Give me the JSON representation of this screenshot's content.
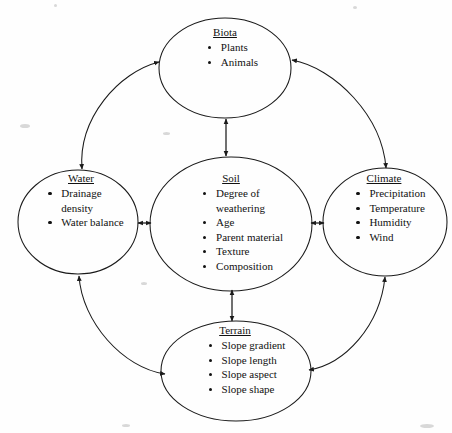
{
  "diagram": {
    "stroke_color": "#1a1a1a",
    "text_color": "#111111",
    "background_color": "#fefefe",
    "nodes": [
      {
        "id": "biota",
        "title": "Biota",
        "items": [
          "Plants",
          "Animals"
        ]
      },
      {
        "id": "water",
        "title": "Water",
        "items": [
          "Drainage\ndensity",
          "Water balance"
        ]
      },
      {
        "id": "soil",
        "title": "Soil",
        "items": [
          "Degree of\nweathering",
          "Age",
          "Parent material",
          "Texture",
          "Composition"
        ]
      },
      {
        "id": "climate",
        "title": "Climate",
        "items": [
          "Precipitation",
          "Temperature",
          "Humidity",
          "Wind"
        ]
      },
      {
        "id": "terrain",
        "title": "Terrain",
        "items": [
          "Slope gradient",
          "Slope length",
          "Slope aspect",
          "Slope shape"
        ]
      }
    ],
    "connections": [
      {
        "id": "water-biota",
        "from": "Water",
        "to": "Biota",
        "style": "double-headed-arc"
      },
      {
        "id": "biota-climate",
        "from": "Biota",
        "to": "Climate",
        "style": "double-headed-arc"
      },
      {
        "id": "climate-terrain",
        "from": "Climate",
        "to": "Terrain",
        "style": "double-headed-arc"
      },
      {
        "id": "terrain-water",
        "from": "Terrain",
        "to": "Water",
        "style": "double-headed-arc"
      },
      {
        "id": "soil-biota",
        "from": "Soil",
        "to": "Biota",
        "style": "double-headed-line"
      },
      {
        "id": "soil-water",
        "from": "Soil",
        "to": "Water",
        "style": "double-headed-line"
      },
      {
        "id": "soil-climate",
        "from": "Soil",
        "to": "Climate",
        "style": "double-headed-line"
      },
      {
        "id": "soil-terrain",
        "from": "Soil",
        "to": "Terrain",
        "style": "double-headed-line"
      }
    ]
  }
}
